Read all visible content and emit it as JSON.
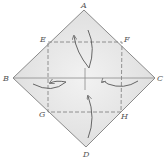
{
  "diagram": {
    "type": "origami-fold-diagram",
    "labels": {
      "top": "A",
      "left": "B",
      "right": "C",
      "bottom": "D",
      "upper_left": "E",
      "upper_right": "F",
      "lower_left": "G",
      "lower_right": "H"
    },
    "fold_arrows": [
      {
        "from": "A",
        "to": "center",
        "direction": "down"
      },
      {
        "from": "B",
        "to": "center",
        "direction": "right"
      },
      {
        "from": "C",
        "to": "center",
        "direction": "left"
      },
      {
        "from": "D",
        "to": "center",
        "direction": "up"
      }
    ],
    "fold_lines": [
      "E-F",
      "F-H",
      "H-G",
      "G-E"
    ],
    "crease_lines": [
      "B-C",
      "vertical-center"
    ],
    "colors": {
      "paper": "#e6e6e6",
      "edge": "#8a8a8a",
      "fold_line": "#7a7a7a",
      "arrow": "#666666",
      "label": "#555555"
    }
  }
}
